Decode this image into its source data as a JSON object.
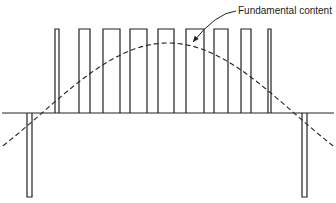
{
  "diagram": {
    "type": "pwm-waveform-with-fundamental",
    "label": "Fundamental content",
    "colors": {
      "stroke": "#222222",
      "background": "#ffffff"
    },
    "baseline_y": 113,
    "baseline_x": [
      2,
      334
    ],
    "positive_top_y": 29,
    "negative_bottom_y": 197,
    "positive_pulses": [
      {
        "x1": 55,
        "x2": 59
      },
      {
        "x1": 79,
        "x2": 90
      },
      {
        "x1": 103,
        "x2": 120
      },
      {
        "x1": 130,
        "x2": 147
      },
      {
        "x1": 158,
        "x2": 174
      },
      {
        "x1": 186,
        "x2": 204
      },
      {
        "x1": 214,
        "x2": 228
      },
      {
        "x1": 241,
        "x2": 251
      },
      {
        "x1": 268,
        "x2": 271
      }
    ],
    "negative_pulses": [
      {
        "x1": 27,
        "x2": 32
      },
      {
        "x1": 302,
        "x2": 307
      }
    ],
    "fundamental": {
      "style": "dashed",
      "start": [
        3,
        148
      ],
      "peak": [
        168,
        43
      ],
      "end": [
        333,
        148
      ],
      "zero_crossings_x": [
        42,
        294
      ]
    },
    "annotation": {
      "text": "Fundamental content",
      "text_pos": [
        238,
        6
      ],
      "arrow_from": [
        236,
        11
      ],
      "arrow_to": [
        193,
        42
      ]
    }
  }
}
